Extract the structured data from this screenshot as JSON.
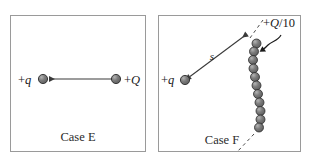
{
  "figure": {
    "background_color": "#ffffff",
    "panel_border_color": "#9a9a9a",
    "sphere_color": "#6e6e6e",
    "sphere_outline_color": "#2c2c2c",
    "line_color": "#3a3a3a"
  },
  "panels": [
    {
      "id": "case-e",
      "caption": "Case E",
      "labels": {
        "left_charge": "+q",
        "right_charge": "+Q"
      },
      "objects": {
        "left_sphere": {
          "cx": 43,
          "cy": 79,
          "r": 4.6
        },
        "right_sphere": {
          "cx": 116,
          "cy": 79,
          "r": 4.6
        },
        "force_arrow": {
          "from_x": 116,
          "from_y": 79,
          "to_x": 48,
          "to_y": 79,
          "direction": "left"
        }
      }
    },
    {
      "id": "case-f",
      "caption": "Case F",
      "labels": {
        "point_charge": "+q",
        "chain_charge": "+Q/10",
        "distance": "s"
      },
      "objects": {
        "point_sphere": {
          "cx": 185,
          "cy": 80,
          "r": 4.6
        },
        "distance_arrow": {
          "from_x": 189,
          "from_y": 77,
          "to_x": 248,
          "to_y": 33,
          "double_headed": true
        },
        "chain_sphere_count": 11,
        "chain_spheres": [
          {
            "cx": 256.5,
            "cy": 43.5,
            "r": 4.5
          },
          {
            "cx": 254.0,
            "cy": 51.5,
            "r": 4.5
          },
          {
            "cx": 253.0,
            "cy": 60.0,
            "r": 4.5
          },
          {
            "cx": 253.5,
            "cy": 68.5,
            "r": 4.5
          },
          {
            "cx": 255.0,
            "cy": 77.0,
            "r": 4.5
          },
          {
            "cx": 256.5,
            "cy": 85.5,
            "r": 4.5
          },
          {
            "cx": 258.0,
            "cy": 94.0,
            "r": 4.5
          },
          {
            "cx": 259.5,
            "cy": 102.5,
            "r": 4.5
          },
          {
            "cx": 260.5,
            "cy": 111.0,
            "r": 4.5
          },
          {
            "cx": 260.5,
            "cy": 119.5,
            "r": 4.5
          },
          {
            "cx": 259.0,
            "cy": 127.5,
            "r": 4.5
          }
        ],
        "dashed_top": {
          "x1": 249,
          "y1": 37,
          "x2": 262,
          "y2": 21
        },
        "dashed_bottom": {
          "x1": 255,
          "y1": 133,
          "x2": 240,
          "y2": 150
        },
        "leader_arrow": "curved-arrow-from-label-to-chain"
      }
    }
  ]
}
